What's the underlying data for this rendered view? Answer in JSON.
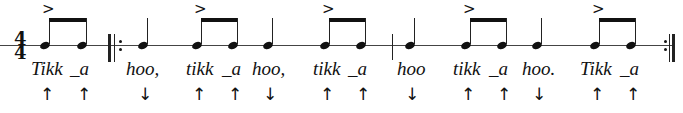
{
  "time_signature": {
    "top": "4",
    "bottom": "4"
  },
  "accent_glyph": ">",
  "arrows": {
    "up": "↑",
    "down": "↓"
  },
  "notes": [
    {
      "x": 45,
      "syl": "Tikk",
      "sx": 31,
      "dir": "up",
      "accent": true
    },
    {
      "x": 82,
      "syl": "_a",
      "sx": 70,
      "dir": "up"
    },
    {
      "x": 143,
      "syl": "hoo,",
      "sx": 126,
      "dir": "down"
    },
    {
      "x": 197,
      "syl": "tikk",
      "sx": 186,
      "dir": "up",
      "accent": true
    },
    {
      "x": 233,
      "syl": "_a",
      "sx": 222,
      "dir": "up"
    },
    {
      "x": 268,
      "syl": "hoo,",
      "sx": 252,
      "dir": "down"
    },
    {
      "x": 325,
      "syl": "tikk",
      "sx": 313,
      "dir": "up",
      "accent": true
    },
    {
      "x": 361,
      "syl": "_a",
      "sx": 348,
      "dir": "up"
    },
    {
      "x": 410,
      "syl": "hoo",
      "sx": 397,
      "dir": "down"
    },
    {
      "x": 466,
      "syl": "tikk",
      "sx": 453,
      "dir": "up",
      "accent": true
    },
    {
      "x": 502,
      "syl": "_a",
      "sx": 489,
      "dir": "up"
    },
    {
      "x": 537,
      "syl": "hoo.",
      "sx": 522,
      "dir": "down"
    },
    {
      "x": 595,
      "syl": "Tikk",
      "sx": 580,
      "dir": "up",
      "accent": true
    },
    {
      "x": 631,
      "syl": "_a",
      "sx": 620,
      "dir": "up"
    }
  ]
}
